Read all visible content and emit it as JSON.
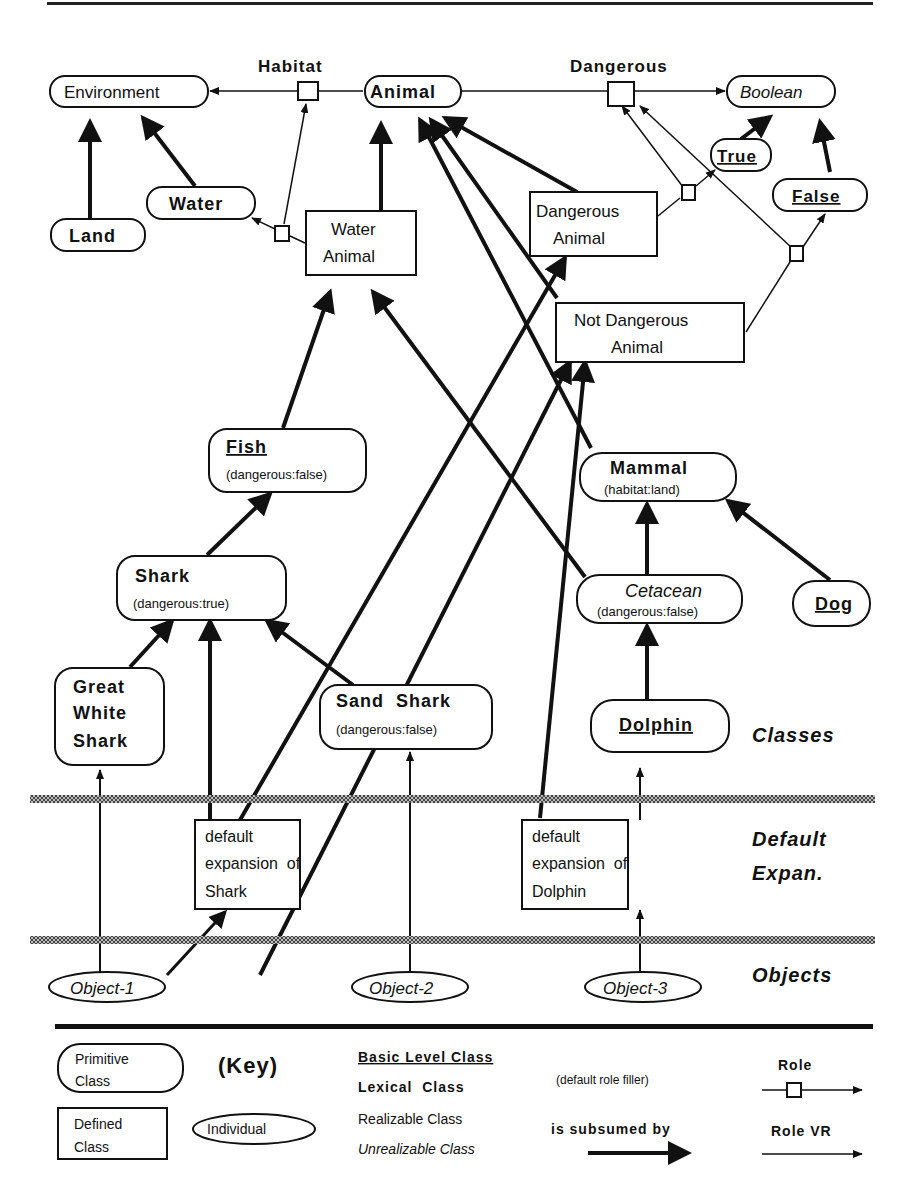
{
  "roles": {
    "habitat": "Habitat",
    "dangerous": "Dangerous"
  },
  "nodes": {
    "environment": "Environment",
    "animal": "Animal",
    "boolean": "Boolean",
    "true": "True",
    "false": "False",
    "water": "Water",
    "land": "Land",
    "water_animal_1": "Water",
    "water_animal_2": "Animal",
    "dangerous_animal_1": "Dangerous",
    "dangerous_animal_2": "Animal",
    "not_dangerous_animal_1": "Not Dangerous",
    "not_dangerous_animal_2": "Animal",
    "fish": "Fish",
    "fish_sub": "(dangerous:false)",
    "mammal": "Mammal",
    "mammal_sub": "(habitat:land)",
    "shark": "Shark",
    "shark_sub": "(dangerous:true)",
    "cetacean": "Cetacean",
    "cetacean_sub": "(dangerous:false)",
    "dog": "Dog",
    "gws_1": "Great",
    "gws_2": "White",
    "gws_3": "Shark",
    "sand_shark": "Sand  Shark",
    "sand_shark_sub": "(dangerous:false)",
    "dolphin": "Dolphin",
    "dexp_shark_1": "default",
    "dexp_shark_2": "expansion  of",
    "dexp_shark_3": "Shark",
    "dexp_dolphin_1": "default",
    "dexp_dolphin_2": "expansion  of",
    "dexp_dolphin_3": "Dolphin",
    "object1": "Object-1",
    "object2": "Object-2",
    "object3": "Object-3"
  },
  "layers": {
    "classes": "Classes",
    "default_1": "Default",
    "default_2": "Expan.",
    "objects": "Objects"
  },
  "key": {
    "title": "(Key)",
    "primitive_1": "Primitive",
    "primitive_2": "Class",
    "defined_1": "Defined",
    "defined_2": "Class",
    "individual": "Individual",
    "basic_level": "Basic Level Class",
    "lexical": "Lexical  Class",
    "realizable": "Realizable Class",
    "unrealizable": "Unrealizable Class",
    "default_filler": "(default role filler)",
    "subsumed": "is subsumed by",
    "role": "Role",
    "role_vr": "Role VR"
  }
}
